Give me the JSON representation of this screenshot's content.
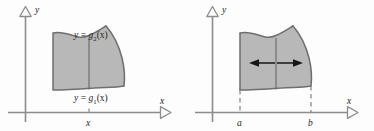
{
  "figure": {
    "name": "double-integral-region-diagrams",
    "panel_count": 2,
    "colors": {
      "background": "#fdfdfd",
      "axis": "#8c8c8c",
      "region_fill": "#b8b8b8",
      "region_stroke": "#6e6e6e",
      "divider_line": "#6e6e6e",
      "arrow_fill": "#161616",
      "dashed_line": "#8c8c8c",
      "text": "#252525"
    }
  },
  "left_panel": {
    "name": "vertical-strip-region",
    "y_axis_label": "y",
    "x_axis_label": "x",
    "upper_curve_label": {
      "lhs": "y",
      "equals": "=",
      "fn": "g",
      "subscript": "2",
      "arg": "(x)",
      "full": "y = g2(x)"
    },
    "lower_curve_label": {
      "lhs": "y",
      "equals": "=",
      "fn": "g",
      "subscript": "1",
      "arg": "(x)",
      "full": "y = g1(x)"
    },
    "x_tick_label": "x"
  },
  "right_panel": {
    "name": "interval-region",
    "y_axis_label": "y",
    "x_axis_label": "x",
    "left_bound_label": "a",
    "right_bound_label": "b",
    "arrow_left_name": "left-arrow",
    "arrow_right_name": "right-arrow"
  }
}
